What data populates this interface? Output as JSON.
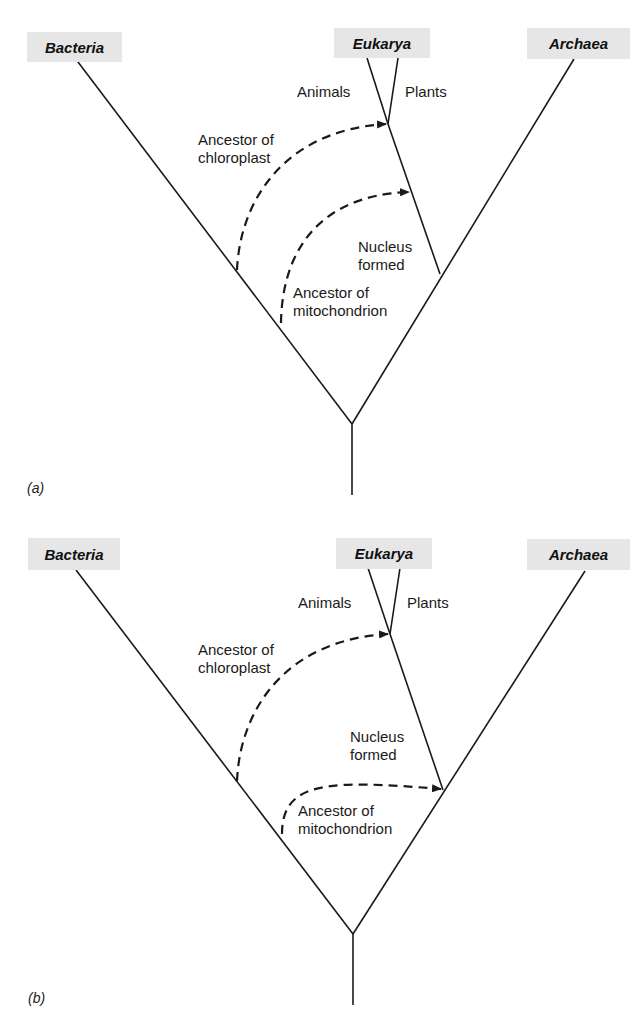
{
  "colors": {
    "line": "#1a1a1a",
    "domain_box_bg": "#e6e6e6",
    "background": "#ffffff"
  },
  "panels": [
    {
      "id": "a",
      "panel_label": "(a)",
      "domains": {
        "bacteria": "Bacteria",
        "eukarya": "Eukarya",
        "archaea": "Archaea"
      },
      "branches": {
        "animals": "Animals",
        "plants": "Plants"
      },
      "events": {
        "nucleus_line1": "Nucleus",
        "nucleus_line2": "formed",
        "chloroplast_line1": "Ancestor of",
        "chloroplast_line2": "chloroplast",
        "mitochondrion_line1": "Ancestor of",
        "mitochondrion_line2": "mitochondrion"
      },
      "arrows": {
        "chloroplast_target": "Eukarya above Animals/Plants split",
        "mitochondrion_target": "Eukarya lineage above nucleus formation"
      }
    },
    {
      "id": "b",
      "panel_label": "(b)",
      "domains": {
        "bacteria": "Bacteria",
        "eukarya": "Eukarya",
        "archaea": "Archaea"
      },
      "branches": {
        "animals": "Animals",
        "plants": "Plants"
      },
      "events": {
        "nucleus_line1": "Nucleus",
        "nucleus_line2": "formed",
        "chloroplast_line1": "Ancestor of",
        "chloroplast_line2": "chloroplast",
        "mitochondrion_line1": "Ancestor of",
        "mitochondrion_line2": "mitochondrion"
      },
      "arrows": {
        "chloroplast_target": "Eukarya above Animals/Plants split",
        "mitochondrion_target": "Eukarya/Archaea junction before nucleus formation"
      }
    }
  ]
}
